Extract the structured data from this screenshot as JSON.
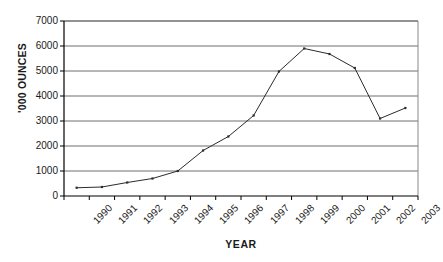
{
  "chart_data": {
    "type": "line",
    "title": "",
    "xlabel": "YEAR",
    "ylabel": "'000 OUNCES",
    "categories": [
      "1990",
      "1991",
      "1992",
      "1993",
      "1994",
      "1995",
      "1996",
      "1997",
      "1998",
      "1999",
      "2000",
      "2001",
      "2002",
      "2003"
    ],
    "x": [
      1990,
      1991,
      1992,
      1993,
      1994,
      1995,
      1996,
      1997,
      1998,
      1999,
      2000,
      2001,
      2002,
      2003
    ],
    "values": [
      330,
      360,
      540,
      700,
      1000,
      1820,
      2380,
      3220,
      4980,
      5900,
      5680,
      5120,
      3100,
      3520
    ],
    "series": [
      {
        "name": "Production",
        "values": [
          330,
          360,
          540,
          700,
          1000,
          1820,
          2380,
          3220,
          4980,
          5900,
          5680,
          5120,
          3100,
          3520
        ]
      }
    ],
    "ylim": [
      0,
      7000
    ],
    "yticks": [
      0,
      1000,
      2000,
      3000,
      4000,
      5000,
      6000,
      7000
    ],
    "ytick_labels": [
      "0",
      "1000",
      "2000",
      "3000",
      "4000",
      "5000",
      "6000",
      "7000"
    ],
    "grid": "horizontal",
    "legend": "none",
    "line_color": "#2b2b2b",
    "marker": "dot",
    "axis_color": "#000000",
    "grid_color": "#6e6e6e"
  }
}
